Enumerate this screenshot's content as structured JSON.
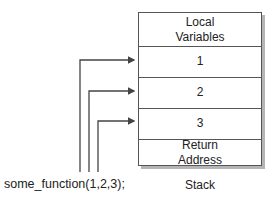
{
  "stack": {
    "cells": [
      {
        "label": "Local\nVariables"
      },
      {
        "label": "1"
      },
      {
        "label": "2"
      },
      {
        "label": "3"
      },
      {
        "label": "Return\nAddress"
      }
    ],
    "caption": "Stack"
  },
  "call": {
    "text": "some_function(1,2,3);",
    "arguments": [
      "1",
      "2",
      "3"
    ]
  },
  "colors": {
    "line": "#444444",
    "shadow": "#b5b5b5"
  }
}
